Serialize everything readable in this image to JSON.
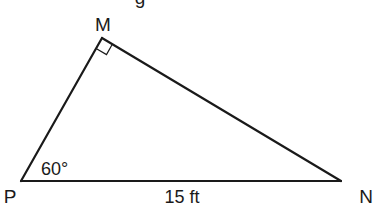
{
  "figure": {
    "top_cut_text": "g",
    "vertices": {
      "M": {
        "label": "M"
      },
      "P": {
        "label": "P"
      },
      "N": {
        "label": "N"
      }
    },
    "angle_P_label": "60°",
    "right_angle_at": "M",
    "side_PN_label": "15 ft"
  }
}
